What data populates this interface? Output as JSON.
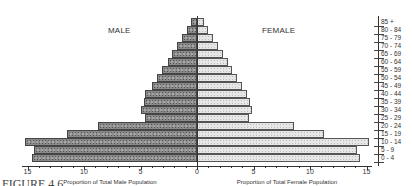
{
  "labels": {
    "male": "MALE",
    "female": "FEMALE",
    "male_xlabel": "Proportion of Total Male Population",
    "female_xlabel": "Proportion of Total Female Population",
    "figure": "FIGURE 4.6"
  },
  "chart_data": {
    "type": "bar",
    "subtype": "population-pyramid",
    "title": "",
    "categories": [
      "85 +",
      "80 - 84",
      "75 - 79",
      "70 - 74",
      "65 - 69",
      "60 - 64",
      "55 - 59",
      "50 - 54",
      "45 - 49",
      "40 - 44",
      "35 - 39",
      "30 - 34",
      "25 - 29",
      "20 - 24",
      "15 - 19",
      "10 - 14",
      "5 - 9",
      "0 - 4"
    ],
    "series": [
      {
        "name": "MALE",
        "side": "left",
        "color": "#8a8a8a",
        "values": [
          0.5,
          0.9,
          1.3,
          1.8,
          2.2,
          2.6,
          3.1,
          3.5,
          4.0,
          4.6,
          4.7,
          5.0,
          4.6,
          8.8,
          11.5,
          15.2,
          14.4,
          14.6
        ]
      },
      {
        "name": "FEMALE",
        "side": "right",
        "color": "#e6e6e6",
        "values": [
          0.6,
          1.0,
          1.4,
          1.9,
          2.3,
          2.7,
          3.1,
          3.5,
          4.0,
          4.4,
          4.7,
          4.9,
          4.6,
          8.6,
          11.2,
          15.2,
          14.2,
          14.4
        ]
      }
    ],
    "xlabel_left": "Proportion of Total Male Population",
    "xlabel_right": "Proportion of Total Female Population",
    "xticks": [
      15,
      10,
      5,
      0,
      5,
      10,
      15
    ],
    "xlim": [
      -15,
      15
    ],
    "grid": false,
    "legend": "titles MALE / FEMALE above each half"
  }
}
